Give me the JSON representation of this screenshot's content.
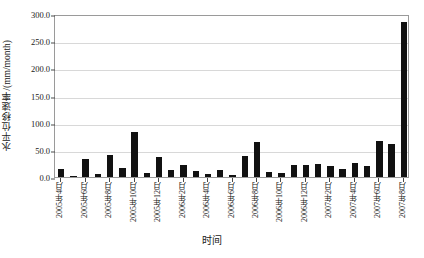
{
  "chart_data": {
    "type": "bar",
    "title": "",
    "xlabel": "时间",
    "ylabel": "水平位移速率/(mm/month)",
    "ylim": [
      0,
      300
    ],
    "ytick_labels": [
      "0.0",
      "50.0",
      "100.0",
      "150.0",
      "200.0",
      "250.0",
      "300.0"
    ],
    "ytick_values": [
      0,
      50,
      100,
      150,
      200,
      250,
      300
    ],
    "grid": true,
    "legend": "none",
    "bar_color": "#111111",
    "categories": [
      "2005年4月",
      "2005年5月",
      "2005年6月",
      "2005年7月",
      "2005年8月",
      "2005年9月",
      "2005年10月",
      "2005年11月",
      "2005年12月",
      "2006年1月",
      "2006年2月",
      "2006年3月",
      "2006年4月",
      "2006年5月",
      "2006年6月",
      "2006年7月",
      "2006年8月",
      "2006年9月",
      "2006年10月",
      "2006年11月",
      "2006年12月",
      "2007年1月",
      "2007年2月",
      "2007年3月",
      "2007年4月",
      "2007年5月",
      "2007年6月",
      "2007年7月",
      "2007年8月"
    ],
    "values": [
      14,
      2,
      33,
      5,
      40,
      17,
      82,
      8,
      36,
      13,
      22,
      11,
      5,
      13,
      3,
      38,
      64,
      10,
      7,
      23,
      22,
      24,
      20,
      15,
      26,
      20,
      67,
      61,
      285
    ],
    "xtick_labels": [
      "2005年4月",
      "2005年6月",
      "2005年8月",
      "2005年10月",
      "2005年12月",
      "2006年2月",
      "2006年4月",
      "2006年6月",
      "2006年8月",
      "2006年10月",
      "2006年12月",
      "2007年2月",
      "2007年4月",
      "2007年6月",
      "2007年8月"
    ],
    "xtick_indices": [
      0,
      2,
      4,
      6,
      8,
      10,
      12,
      14,
      16,
      18,
      20,
      22,
      24,
      26,
      28
    ]
  }
}
